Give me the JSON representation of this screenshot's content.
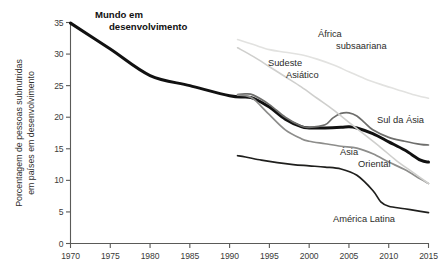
{
  "chart_data": {
    "type": "line",
    "title": "",
    "xlabel": "",
    "ylabel": "Porcentagem de pessoas subnutridas em países em desenvolvimento",
    "ylabel_line1": "Porcentagem de pessoas subnutridas",
    "ylabel_line2": "em países em desenvolvimento",
    "xlim": [
      1970,
      2015
    ],
    "ylim": [
      0,
      35
    ],
    "grid": false,
    "legend_position": "inline-labels",
    "xticks": [
      1970,
      1975,
      1980,
      1985,
      1990,
      1995,
      2000,
      2005,
      2010,
      2015
    ],
    "xtick_labels": [
      "1970",
      "1975",
      "1980",
      "1985",
      "1990",
      "1995",
      "2000",
      "2005",
      "2010",
      "2015"
    ],
    "yticks": [
      0,
      5,
      10,
      15,
      20,
      25,
      30,
      35
    ],
    "ytick_labels": [
      "0",
      "5",
      "10",
      "15",
      "20",
      "25",
      "30",
      "35"
    ],
    "series": [
      {
        "name": "Mundo em desenvolvimento",
        "label_line1": "Mundo em",
        "label_line2": "desenvolvimento",
        "color": "#111111",
        "width": 3.0,
        "bold_label": true,
        "x": [
          1970,
          1975,
          1980,
          1985,
          1990,
          1992,
          1993,
          1995,
          1997,
          1999,
          2000,
          2002,
          2004,
          2005,
          2006,
          2008,
          2010,
          2012,
          2014,
          2015
        ],
        "y": [
          34.9,
          30.8,
          26.6,
          25.0,
          23.4,
          23.2,
          23.0,
          21.6,
          19.7,
          18.5,
          18.3,
          18.3,
          18.4,
          18.5,
          18.3,
          17.4,
          16.1,
          14.8,
          13.2,
          12.9
        ]
      },
      {
        "name": "Sul da Ásia",
        "label_line1": "Sul da Ásia",
        "color": "#6e6e6c",
        "width": 1.7,
        "bold_label": false,
        "x": [
          1991,
          1992,
          1993,
          1995,
          1997,
          1999,
          2000,
          2002,
          2003,
          2004,
          2005,
          2006,
          2007,
          2008,
          2010,
          2012,
          2014,
          2015
        ],
        "y": [
          23.6,
          23.7,
          23.5,
          22.0,
          20.0,
          18.6,
          18.4,
          18.8,
          19.9,
          20.6,
          20.7,
          20.2,
          19.1,
          18.0,
          16.8,
          16.2,
          15.7,
          15.6
        ]
      },
      {
        "name": "Ásia Oriental",
        "label_line1": "Ásia",
        "label_line2": "Oriental",
        "color": "#8d8d8b",
        "width": 1.7,
        "bold_label": false,
        "x": [
          1991,
          1992,
          1993,
          1995,
          1997,
          1999,
          2000,
          2002,
          2004,
          2006,
          2008,
          2010,
          2012,
          2014,
          2015
        ],
        "y": [
          23.5,
          23.4,
          22.9,
          20.4,
          18.0,
          16.6,
          16.2,
          15.8,
          15.4,
          15.1,
          14.2,
          12.9,
          11.7,
          10.2,
          9.5
        ]
      },
      {
        "name": "Sudeste Asiático",
        "label_line1": "Sudeste",
        "label_line2": "Asiático",
        "color": "#cfcfcd",
        "width": 1.6,
        "bold_label": false,
        "x": [
          1991,
          1993,
          1995,
          1997,
          1999,
          2001,
          2003,
          2005,
          2007,
          2009,
          2011,
          2013,
          2015
        ],
        "y": [
          31.0,
          29.6,
          28.0,
          26.4,
          24.8,
          23.0,
          21.2,
          19.2,
          17.2,
          15.2,
          13.1,
          11.3,
          9.5
        ]
      },
      {
        "name": "África subsaariana",
        "label_line1": "África",
        "label_line2": "subsaariana",
        "color": "#e2e2e0",
        "width": 1.6,
        "bold_label": false,
        "x": [
          1991,
          1993,
          1995,
          1997,
          1999,
          2001,
          2003,
          2005,
          2007,
          2009,
          2011,
          2013,
          2015
        ],
        "y": [
          32.3,
          31.5,
          30.7,
          30.3,
          29.9,
          29.2,
          28.3,
          27.2,
          26.1,
          25.2,
          24.4,
          23.6,
          23.0
        ]
      },
      {
        "name": "América Latina",
        "label_line1": "América Latina",
        "color": "#1f1f1d",
        "width": 1.7,
        "bold_label": false,
        "x": [
          1991,
          1992,
          1994,
          1996,
          1998,
          2000,
          2002,
          2004,
          2006,
          2008,
          2009,
          2010,
          2012,
          2014,
          2015
        ],
        "y": [
          13.9,
          13.7,
          13.2,
          12.8,
          12.5,
          12.3,
          12.1,
          11.8,
          10.8,
          8.4,
          6.6,
          5.9,
          5.5,
          5.1,
          4.9
        ]
      }
    ],
    "annotations": [
      {
        "name": "mundo-em-desenvolvimento",
        "text_line1": "Mundo em",
        "text_line2": "desenvolvimento",
        "x": 95,
        "y": 18,
        "bold": true
      },
      {
        "name": "africa-subsaariana",
        "text_line1": "África",
        "text_line2": "subsaariana",
        "x": 318,
        "y": 37,
        "bold": false
      },
      {
        "name": "sudeste-asiatico",
        "text_line1": "Sudeste",
        "text_line2": "Asiático",
        "x": 268,
        "y": 66,
        "bold": false
      },
      {
        "name": "sul-da-asia",
        "text_line1": "Sul da Ásia",
        "x": 377,
        "y": 123,
        "bold": false
      },
      {
        "name": "asia-oriental",
        "text_line1": "Ásia",
        "text_line2": "Oriental",
        "x": 340,
        "y": 155,
        "bold": false
      },
      {
        "name": "america-latina",
        "text_line1": "América Latina",
        "x": 333,
        "y": 222,
        "bold": false
      }
    ]
  }
}
